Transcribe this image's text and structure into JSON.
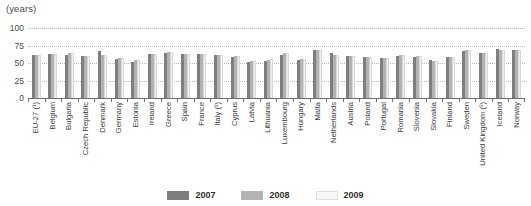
{
  "chart_data": {
    "type": "bar",
    "title": "",
    "subtitle": "",
    "xlabel": "",
    "ylabel": "(years)",
    "unit_label": "(years)",
    "ylim": [
      0,
      100
    ],
    "yticks": [
      0,
      25,
      50,
      75,
      100
    ],
    "ytick_labels": [
      "0",
      "25",
      "50",
      "75",
      "100"
    ],
    "grid": true,
    "grid_style": "dotted-horizontal",
    "legend_position": "bottom-center",
    "categories": [
      "EU-27 (¹)",
      "Belgium",
      "Bulgaria",
      "Czech Republic",
      "Denmark",
      "Germany",
      "Estonia",
      "Ireland",
      "Greece",
      "Spain",
      "France",
      "Italy (²)",
      "Cyprus",
      "Latvia",
      "Lithuania",
      "Luxembourg",
      "Hungary",
      "Malta",
      "Netherlands",
      "Austria",
      "Poland",
      "Portugal",
      "Romania",
      "Slovenia",
      "Slovakia",
      "Finland",
      "Sweden",
      "United Kingdom (²)",
      "Iceland",
      "Norway"
    ],
    "series": [
      {
        "name": "2007",
        "color": "#7f7f7f",
        "values": [
          61,
          63,
          62,
          60,
          67,
          56,
          52,
          63,
          65,
          63,
          63,
          62,
          58,
          52,
          53,
          62,
          55,
          69,
          64,
          60,
          58,
          57,
          60,
          59,
          55,
          59,
          67,
          65,
          70,
          69
        ]
      },
      {
        "name": "2008",
        "color": "#b3b3b3",
        "values": [
          61,
          63,
          65,
          60,
          61,
          57,
          54,
          63,
          66,
          63,
          63,
          62,
          60,
          53,
          55,
          64,
          56,
          69,
          62,
          60,
          58,
          57,
          61,
          60,
          53,
          58,
          68,
          65,
          69,
          69
        ]
      },
      {
        "name": "2009",
        "color": "#f2f2f2",
        "values": [
          61,
          63,
          65,
          60,
          61,
          57,
          54,
          63,
          66,
          63,
          63,
          62,
          60,
          53,
          56,
          65,
          56,
          69,
          61,
          60,
          58,
          57,
          61,
          60,
          53,
          58,
          68,
          65,
          69,
          69
        ]
      }
    ]
  },
  "legend": {
    "items": [
      {
        "label": "2007",
        "swatch_class": "y2007"
      },
      {
        "label": "2008",
        "swatch_class": "y2008"
      },
      {
        "label": "2009",
        "swatch_class": "y2009"
      }
    ]
  },
  "colors": {
    "series_2007": "#7f7f7f",
    "series_2008": "#b3b3b3",
    "series_2009": "#f2f2f2",
    "axis": "#6f6f6f",
    "grid": "#b9b9b9",
    "text": "#3b3b3b",
    "background": "#ffffff"
  }
}
